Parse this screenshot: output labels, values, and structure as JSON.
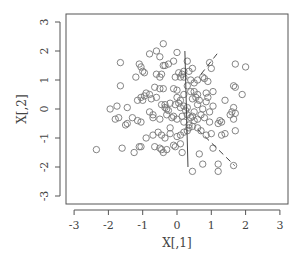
{
  "chart_data": {
    "type": "scatter",
    "title": "",
    "xlabel": "X[,1]",
    "ylabel": "X[,2]",
    "xlim": [
      -3.3,
      3.2
    ],
    "ylim": [
      -3.3,
      3.3
    ],
    "xticks": [
      -3,
      -2,
      -1,
      0,
      1,
      2,
      3
    ],
    "yticks": [
      -3,
      -2,
      -1,
      0,
      1,
      2,
      3
    ],
    "grid": false,
    "legend": null,
    "marker": "open-circle",
    "point_color": "#777777",
    "line_color": "#444444",
    "series": [
      {
        "name": "points",
        "points": [
          [
            -0.4,
            2.25
          ],
          [
            -0.6,
            2.0
          ],
          [
            -0.8,
            1.9
          ],
          [
            -0.5,
            1.8
          ],
          [
            0.0,
            1.95
          ],
          [
            -0.1,
            1.65
          ],
          [
            -0.25,
            1.55
          ],
          [
            -0.4,
            1.5
          ],
          [
            -0.35,
            1.5
          ],
          [
            -1.65,
            1.6
          ],
          [
            -1.1,
            1.55
          ],
          [
            -1.05,
            1.45
          ],
          [
            -1.0,
            1.3
          ],
          [
            -0.95,
            1.25
          ],
          [
            -1.2,
            1.1
          ],
          [
            -0.6,
            1.2
          ],
          [
            -0.5,
            1.1
          ],
          [
            -0.45,
            1.2
          ],
          [
            0.05,
            1.25
          ],
          [
            0.15,
            1.2
          ],
          [
            0.2,
            1.3
          ],
          [
            0.35,
            1.3
          ],
          [
            0.3,
            1.65
          ],
          [
            0.45,
            1.4
          ],
          [
            0.2,
            1.1
          ],
          [
            0.1,
            1.1
          ],
          [
            -0.05,
            1.1
          ],
          [
            0.4,
            1.0
          ],
          [
            0.6,
            1.0
          ],
          [
            0.75,
            1.1
          ],
          [
            0.8,
            1.05
          ],
          [
            0.95,
            1.6
          ],
          [
            1.0,
            1.4
          ],
          [
            0.9,
            0.95
          ],
          [
            1.7,
            1.55
          ],
          [
            2.0,
            1.45
          ],
          [
            0.5,
            0.9
          ],
          [
            0.3,
            0.8
          ],
          [
            -1.65,
            0.8
          ],
          [
            -0.9,
            0.55
          ],
          [
            -0.95,
            0.45
          ],
          [
            -0.8,
            0.5
          ],
          [
            -0.75,
            0.35
          ],
          [
            -1.0,
            0.3
          ],
          [
            -1.05,
            0.4
          ],
          [
            -1.15,
            0.3
          ],
          [
            -0.65,
            0.75
          ],
          [
            -0.5,
            0.7
          ],
          [
            -0.4,
            0.7
          ],
          [
            -0.1,
            0.7
          ],
          [
            0.0,
            0.65
          ],
          [
            0.2,
            0.5
          ],
          [
            0.4,
            0.6
          ],
          [
            0.5,
            0.6
          ],
          [
            0.6,
            0.5
          ],
          [
            0.85,
            0.55
          ],
          [
            0.9,
            0.4
          ],
          [
            1.05,
            0.6
          ],
          [
            1.4,
            0.3
          ],
          [
            1.65,
            0.8
          ],
          [
            1.7,
            0.75
          ],
          [
            1.9,
            0.5
          ],
          [
            0.55,
            0.4
          ],
          [
            0.45,
            0.35
          ],
          [
            -1.95,
            0.0
          ],
          [
            -1.75,
            0.1
          ],
          [
            -1.45,
            0.05
          ],
          [
            -1.8,
            -0.35
          ],
          [
            -1.7,
            -0.3
          ],
          [
            -1.3,
            -0.3
          ],
          [
            -1.15,
            -0.4
          ],
          [
            -1.05,
            -0.45
          ],
          [
            -1.5,
            -0.55
          ],
          [
            -1.45,
            -0.5
          ],
          [
            -0.7,
            -0.2
          ],
          [
            -0.7,
            -0.3
          ],
          [
            -0.5,
            -0.35
          ],
          [
            -0.3,
            -0.2
          ],
          [
            -0.25,
            -0.05
          ],
          [
            -0.2,
            0.2
          ],
          [
            -0.05,
            0.15
          ],
          [
            0.05,
            0.2
          ],
          [
            0.1,
            0.05
          ],
          [
            0.2,
            0.1
          ],
          [
            0.25,
            -0.05
          ],
          [
            -0.35,
            0.15
          ],
          [
            -0.35,
            0.05
          ],
          [
            -0.45,
            0.15
          ],
          [
            -0.3,
            0.0
          ],
          [
            -0.15,
            -0.3
          ],
          [
            -0.1,
            -0.25
          ],
          [
            0.0,
            -0.35
          ],
          [
            0.15,
            -0.25
          ],
          [
            0.3,
            -0.2
          ],
          [
            0.4,
            -0.3
          ],
          [
            0.45,
            -0.25
          ],
          [
            0.5,
            -0.4
          ],
          [
            0.6,
            -0.35
          ],
          [
            0.7,
            -0.2
          ],
          [
            0.8,
            -0.3
          ],
          [
            0.95,
            -0.1
          ],
          [
            1.05,
            0.1
          ],
          [
            0.6,
            0.15
          ],
          [
            0.75,
            0.0
          ],
          [
            1.25,
            -0.4
          ],
          [
            1.2,
            -0.5
          ],
          [
            1.3,
            -0.45
          ],
          [
            1.55,
            -0.2
          ],
          [
            1.6,
            -0.1
          ],
          [
            1.65,
            -0.35
          ],
          [
            1.7,
            -0.15
          ],
          [
            1.65,
            0.05
          ],
          [
            1.4,
            -0.85
          ],
          [
            1.3,
            -0.9
          ],
          [
            1.7,
            -0.75
          ],
          [
            -0.9,
            -1.0
          ],
          [
            -0.7,
            -0.9
          ],
          [
            -0.55,
            -0.8
          ],
          [
            -0.45,
            -0.9
          ],
          [
            -0.35,
            -1.0
          ],
          [
            -0.2,
            -0.85
          ],
          [
            -0.2,
            -0.65
          ],
          [
            0.0,
            -0.95
          ],
          [
            0.1,
            -0.9
          ],
          [
            0.2,
            -0.8
          ],
          [
            0.3,
            -0.75
          ],
          [
            0.35,
            -0.55
          ],
          [
            0.45,
            -0.6
          ],
          [
            0.6,
            -0.65
          ],
          [
            0.7,
            -0.75
          ],
          [
            0.85,
            -0.9
          ],
          [
            1.0,
            -0.85
          ],
          [
            -1.05,
            -1.3
          ],
          [
            -1.1,
            -1.3
          ],
          [
            -0.65,
            -1.3
          ],
          [
            -0.5,
            -1.35
          ],
          [
            -0.45,
            -1.4
          ],
          [
            -0.4,
            -1.5
          ],
          [
            -0.3,
            -1.4
          ],
          [
            -0.1,
            -1.25
          ],
          [
            0.1,
            -1.2
          ],
          [
            -0.05,
            -1.3
          ],
          [
            0.15,
            -1.5
          ],
          [
            -2.35,
            -1.4
          ],
          [
            -1.6,
            -1.35
          ],
          [
            -1.25,
            -1.5
          ],
          [
            0.65,
            -1.55
          ],
          [
            0.75,
            -1.9
          ],
          [
            1.05,
            -1.35
          ],
          [
            1.2,
            -1.9
          ],
          [
            1.2,
            -2.15
          ],
          [
            0.45,
            -2.15
          ],
          [
            1.65,
            -1.95
          ],
          [
            0.0,
            0.4
          ],
          [
            0.1,
            0.3
          ],
          [
            0.3,
            0.05
          ],
          [
            0.5,
            -0.1
          ],
          [
            0.2,
            -0.45
          ],
          [
            0.35,
            -0.65
          ],
          [
            -0.6,
            0.4
          ],
          [
            -0.8,
            -0.1
          ],
          [
            0.65,
            0.3
          ],
          [
            0.85,
            0.25
          ],
          [
            0.95,
            -0.45
          ]
        ]
      }
    ],
    "lines": [
      {
        "name": "solid-axis-line",
        "style": "solid",
        "x": [
          0.23,
          0.32
        ],
        "y": [
          2.0,
          -2.0
        ]
      },
      {
        "name": "dashed-upper-segment",
        "style": "dashed",
        "x": [
          0.7,
          1.2
        ],
        "y": [
          1.2,
          1.95
        ]
      },
      {
        "name": "dashed-lower-segment",
        "style": "dashed",
        "x": [
          0.6,
          1.68
        ],
        "y": [
          -0.7,
          -1.95
        ]
      }
    ]
  }
}
